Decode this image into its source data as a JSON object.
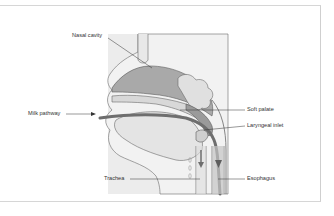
{
  "diagram": {
    "type": "anatomical cross-section",
    "labels": {
      "nasal_cavity": "Nasal cavity",
      "milk_pathway": "Milk pathway",
      "soft_palate": "Soft palate",
      "laryngeal_inlet": "Laryngeal inlet",
      "trachea": "Trachea",
      "esophagus": "Esophagus"
    },
    "colors": {
      "background_panel": "#ebebeb",
      "tissue_light": "#e6e6e6",
      "tissue_mid": "#bdbdbd",
      "tissue_dark": "#8f8f8f",
      "pathway": "#6e6e6e",
      "outline": "#5a5a5a",
      "leader_line": "#333333",
      "frame_border": "#d6d6d6"
    }
  }
}
